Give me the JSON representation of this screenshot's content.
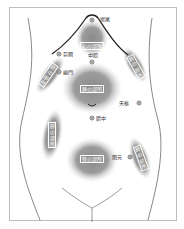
{
  "diagram": {
    "points": {
      "top": "鳩尾",
      "juketsu": "巨闕",
      "yumon": "幽門",
      "chukan": "中脘",
      "tensu": "天枢",
      "sessei": "臍中",
      "kangen": "関元"
    },
    "zones": {
      "heart": "心の部所",
      "spleen": "脾の部所",
      "kidney": "腎の部所",
      "lung": "肺の部所",
      "liver_left": "肝の部所",
      "liver_right": "肝の部所",
      "lung_lower": "肺の部所"
    }
  }
}
